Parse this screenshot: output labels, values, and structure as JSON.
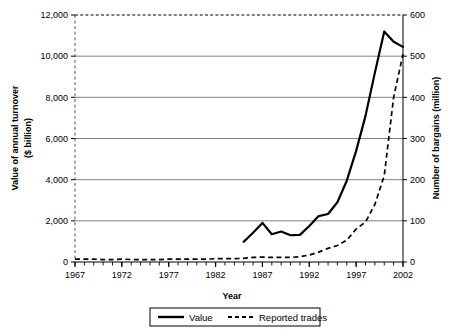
{
  "chart_data": {
    "type": "line",
    "title": "",
    "xlabel": "Year",
    "ylabel": "Value of annual turnover ($ billion)",
    "ylabel_line1": "Value of annual turnover",
    "ylabel_line2": "($ billion)",
    "y2label": "Number of bargains (million)",
    "xlim": [
      1967,
      2002
    ],
    "ylim": [
      0,
      12000
    ],
    "y2lim": [
      0,
      600
    ],
    "xticks": [
      1967,
      1972,
      1977,
      1982,
      1987,
      1992,
      1997,
      2002
    ],
    "xtick_labels": [
      "1967",
      "1972",
      "1977",
      "1982",
      "1987",
      "1992",
      "1997",
      "2002"
    ],
    "xminor_step": 1,
    "yticks": [
      0,
      2000,
      4000,
      6000,
      8000,
      10000,
      12000
    ],
    "ytick_labels": [
      "0",
      "2,000",
      "4,000",
      "6,000",
      "8,000",
      "10,000",
      "12,000"
    ],
    "y2ticks": [
      0,
      100,
      200,
      300,
      400,
      500,
      600
    ],
    "y2tick_labels": [
      "0",
      "100",
      "200",
      "300",
      "400",
      "500",
      "600"
    ],
    "grid": "horizontal",
    "legend_position": "bottom",
    "series": [
      {
        "name": "Value",
        "style": "solid",
        "axis": "left",
        "color": "#000000",
        "x": [
          1985,
          1986,
          1987,
          1988,
          1989,
          1990,
          1991,
          1992,
          1993,
          1994,
          1995,
          1996,
          1997,
          1998,
          1999,
          2000,
          2001,
          2002
        ],
        "values": [
          980,
          1420,
          1900,
          1350,
          1480,
          1300,
          1320,
          1750,
          2230,
          2330,
          2900,
          3950,
          5400,
          7100,
          9200,
          11200,
          10700,
          10450
        ]
      },
      {
        "name": "Reported trades",
        "style": "dashed",
        "axis": "right",
        "color": "#000000",
        "x": [
          1967,
          1968,
          1969,
          1970,
          1971,
          1972,
          1973,
          1974,
          1975,
          1976,
          1977,
          1978,
          1979,
          1980,
          1981,
          1982,
          1983,
          1984,
          1985,
          1986,
          1987,
          1988,
          1989,
          1990,
          1991,
          1992,
          1993,
          1994,
          1995,
          1996,
          1997,
          1998,
          1999,
          2000,
          2001,
          2002
        ],
        "values": [
          7,
          7,
          7,
          6,
          6,
          7,
          6,
          6,
          6,
          6,
          7,
          7,
          7,
          7,
          7,
          8,
          8,
          8,
          9,
          11,
          12,
          11,
          11,
          11,
          13,
          17,
          24,
          33,
          40,
          53,
          80,
          97,
          140,
          210,
          400,
          505
        ]
      }
    ]
  },
  "legend": {
    "items": [
      {
        "label": "Value",
        "style": "solid"
      },
      {
        "label": "Reported trades",
        "style": "dashed"
      }
    ]
  }
}
